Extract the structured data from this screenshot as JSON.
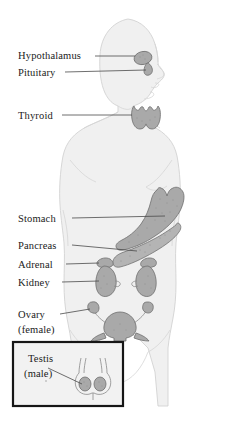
{
  "figure": {
    "type": "anatomical-diagram",
    "background_color": "#ffffff",
    "body_fill_color": "#f0f0f0",
    "organ_fill_color": "#a9a9a9",
    "label_color": "#1a1a1a",
    "leader_line_color": "#4a4a4a",
    "inset_border_color": "#161616"
  },
  "labels": [
    {
      "id": "hypothalamus",
      "text": "Hypothalamus",
      "x": 18,
      "y": 59
    },
    {
      "id": "pituitary",
      "text": "Pituitary",
      "x": 18,
      "y": 75
    },
    {
      "id": "thyroid",
      "text": "Thyroid",
      "x": 18,
      "y": 118
    },
    {
      "id": "stomach",
      "text": "Stomach",
      "x": 18,
      "y": 221
    },
    {
      "id": "pancreas",
      "text": "Pancreas",
      "x": 18,
      "y": 248
    },
    {
      "id": "adrenal",
      "text": "Adrenal",
      "x": 18,
      "y": 267
    },
    {
      "id": "kidney",
      "text": "Kidney",
      "x": 18,
      "y": 285
    },
    {
      "id": "ovary",
      "text": "Ovary",
      "x": 18,
      "y": 317
    },
    {
      "id": "ovary_sub",
      "text": "(female)",
      "x": 18,
      "y": 332
    }
  ],
  "inset": {
    "label_line1": "Testis",
    "label_line2": "(male)",
    "box": {
      "x": 13,
      "y": 342,
      "width": 110,
      "height": 64
    }
  },
  "organs": [
    {
      "id": "hypothalamus",
      "name": "hypothalamus-gland"
    },
    {
      "id": "pituitary",
      "name": "pituitary-gland"
    },
    {
      "id": "thyroid",
      "name": "thyroid-gland"
    },
    {
      "id": "stomach",
      "name": "stomach-organ"
    },
    {
      "id": "pancreas",
      "name": "pancreas-organ"
    },
    {
      "id": "adrenal_left",
      "name": "adrenal-gland-left"
    },
    {
      "id": "adrenal_right",
      "name": "adrenal-gland-right"
    },
    {
      "id": "kidney_left",
      "name": "kidney-left"
    },
    {
      "id": "kidney_right",
      "name": "kidney-right"
    },
    {
      "id": "uterus",
      "name": "uterus-organ"
    },
    {
      "id": "ovary_left",
      "name": "ovary-left"
    },
    {
      "id": "ovary_right",
      "name": "ovary-right"
    },
    {
      "id": "testis",
      "name": "testis-organ"
    }
  ]
}
